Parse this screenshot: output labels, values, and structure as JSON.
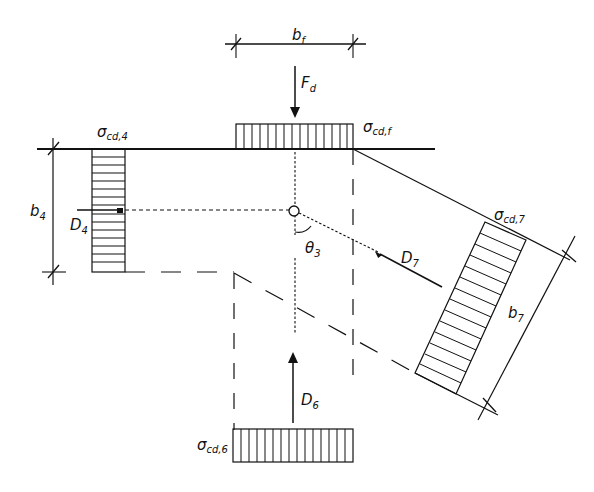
{
  "header": {
    "partial_title": ""
  },
  "labels": {
    "bf": {
      "main": "b",
      "sub": "f"
    },
    "Fd": {
      "main": "F",
      "sub": "d"
    },
    "sigma_cd_f": {
      "main": "σ",
      "sub": "cd,f"
    },
    "sigma_cd_4": {
      "main": "σ",
      "sub": "cd,4"
    },
    "b4": {
      "main": "b",
      "sub": "4"
    },
    "D4": {
      "main": "D",
      "sub": "4"
    },
    "theta3": {
      "main": "θ",
      "sub": "3"
    },
    "D7": {
      "main": "D",
      "sub": "7"
    },
    "sigma_cd_7": {
      "main": "σ",
      "sub": "cd,7"
    },
    "b7": {
      "main": "b",
      "sub": "7"
    },
    "D6": {
      "main": "D",
      "sub": "6"
    },
    "sigma_cd_6": {
      "main": "σ",
      "sub": "cd,6"
    }
  },
  "colors": {
    "stroke": "#111111",
    "background": "#ffffff"
  }
}
